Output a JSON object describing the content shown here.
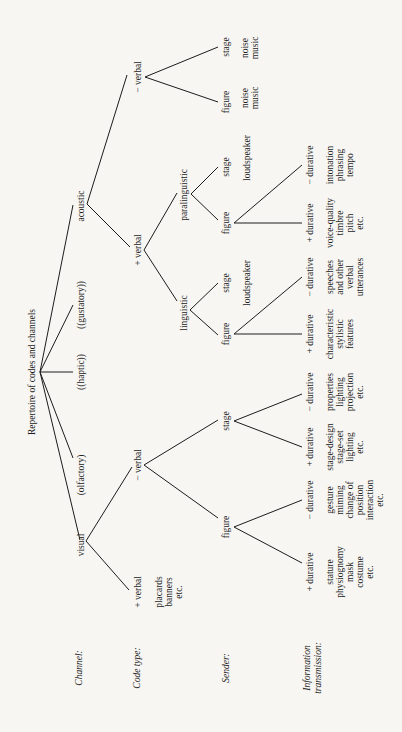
{
  "title": "Repertoire of codes and channels",
  "row_labels": {
    "channel": "Channel:",
    "code_type": "Code type:",
    "sender": "Sender:",
    "info_1": "Information",
    "info_2": "transmission:"
  },
  "channels": {
    "visual": "visual",
    "olfactory": "(olfactory)",
    "haptic": "((haptic))",
    "gustatory": "((gustatory))",
    "acoustic": "acoustic"
  },
  "code_types": {
    "visual_plus_verbal": "+ verbal",
    "visual_minus_verbal": "− verbal",
    "acoustic_plus_verbal": "+ verbal",
    "acoustic_minus_verbal": "− verbal"
  },
  "subtypes": {
    "linguistic": "linguistic",
    "paralinguistic": "paralinguistic"
  },
  "senders": {
    "visual_figure": "figure",
    "visual_stage": "stage",
    "ling_figure": "figure",
    "ling_stage": "stage",
    "para_figure": "figure",
    "para_stage": "stage",
    "acmv_figure": "figure",
    "acmv_stage": "stage"
  },
  "durative": {
    "plus": "+ durative",
    "minus": "− durative"
  },
  "info": {
    "placards": [
      "placards",
      "banners",
      "etc."
    ],
    "fig_plus": [
      "stature",
      "physiognomy",
      "mask",
      "costume",
      "etc."
    ],
    "fig_minus": [
      "gesture",
      "miming",
      "change of",
      "position",
      "interaction",
      "etc."
    ],
    "stage_plus": [
      "stage-design",
      "stage-set",
      "lighting",
      "etc."
    ],
    "stage_minus": [
      "properties",
      "lighting",
      "projection",
      "etc."
    ],
    "ling_plus": [
      "characteristic",
      "stylistic",
      "features"
    ],
    "ling_minus": [
      "speeches",
      "and other",
      "verbal",
      "utterances"
    ],
    "ling_stage": [
      "loudspeaker"
    ],
    "para_plus": [
      "voice-quality",
      "timbre",
      "pitch",
      "etc."
    ],
    "para_minus": [
      "intonation",
      "phrasing",
      "tempo"
    ],
    "para_stage": [
      "loudspeaker"
    ],
    "acmv_figure": [
      "noise",
      "music"
    ],
    "acmv_stage": [
      "noise",
      "music"
    ]
  }
}
